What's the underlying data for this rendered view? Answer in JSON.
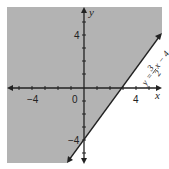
{
  "diagram": {
    "type": "coordinate-plane-linear-inequality",
    "shaded_region_color": "#b3b3b3",
    "background_color": "#ffffff",
    "axis_color": "#222222",
    "axes": {
      "x_label": "x",
      "y_label": "y",
      "x_tick_labels": [
        "-4",
        "0",
        "4"
      ],
      "y_tick_labels": [
        "4",
        "-4"
      ],
      "origin_label": "0"
    },
    "boundary_line": {
      "equation_parts": {
        "lhs": "y",
        "equals": "=",
        "num": "3",
        "den": "2",
        "var": "x",
        "minus": "−",
        "const": "4"
      },
      "slope": 1.5,
      "intercept": -4,
      "style": "solid"
    },
    "shaded_side": "above-left of line"
  },
  "labels": {
    "x_neg4": "−4",
    "x_zero": "0",
    "x_pos4": "4",
    "y_pos4": "4",
    "y_neg4": "−4",
    "x_axis": "x",
    "y_axis": "y",
    "eq_y": "y",
    "eq_eq": "=",
    "eq_num": "3",
    "eq_den": "2",
    "eq_rest": "x − 4"
  }
}
